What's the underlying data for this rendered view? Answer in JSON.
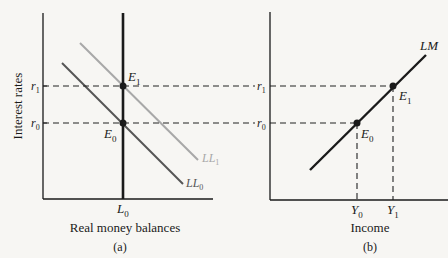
{
  "panel_a": {
    "y_axis_label": "Interest rates",
    "x_axis_label": "Real money balances",
    "caption": "(a)",
    "ticks": {
      "r1": "r",
      "r1_sub": "1",
      "r0": "r",
      "r0_sub": "0",
      "L0": "L",
      "L0_sub": "0"
    },
    "points": {
      "E1": "E",
      "E1_sub": "1",
      "E0": "E",
      "E0_sub": "0"
    },
    "curves": {
      "LL1": "LL",
      "LL1_sub": "1",
      "LL0": "LL",
      "LL0_sub": "0"
    }
  },
  "panel_b": {
    "x_axis_label": "Income",
    "caption": "(b)",
    "ticks": {
      "r1": "r",
      "r1_sub": "1",
      "r0": "r",
      "r0_sub": "0",
      "Y0": "Y",
      "Y0_sub": "0",
      "Y1": "Y",
      "Y1_sub": "1"
    },
    "points": {
      "E1": "E",
      "E1_sub": "1",
      "E0": "E",
      "E0_sub": "0"
    },
    "curves": {
      "LM": "LM"
    }
  },
  "colors": {
    "axis": "#1a1a1a",
    "LL0": "#555555",
    "LL1": "#a8a8a8",
    "L0": "#1a1a1a",
    "LM": "#1a1a1a",
    "dashed": "#222222"
  }
}
